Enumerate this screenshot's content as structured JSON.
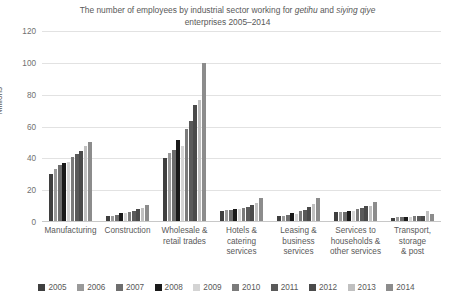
{
  "chart_data": {
    "type": "bar",
    "title": "The number of employees by industrial sector working for getihu and siying qiye enterprises 2005–2014",
    "title_parts": {
      "line1_a": "The number of employees by industrial sector working for ",
      "line1_italic1": "getihu",
      "line1_b": " and ",
      "line1_italic2": "siying",
      "line2_italic": "qiye",
      "line2_b": " enterprises 2005–2014"
    },
    "xlabel": "",
    "ylabel": "Millions",
    "ylim": [
      0,
      120
    ],
    "yticks": [
      0,
      20,
      40,
      60,
      80,
      100,
      120
    ],
    "grid": true,
    "legend_position": "bottom",
    "categories": [
      "Manufacturing",
      "Construction",
      "Wholesale & retail trades",
      "Hotels & catering services",
      "Leasing & business services",
      "Services to households & other services",
      "Transport, storage & post"
    ],
    "category_label_lines": [
      [
        "Manufacturing"
      ],
      [
        "Construction"
      ],
      [
        "Wholesale &",
        "retail trades"
      ],
      [
        "Hotels &",
        "catering",
        "services"
      ],
      [
        "Leasing &",
        "business",
        "services"
      ],
      [
        "Services to",
        "households &",
        "other services"
      ],
      [
        "Transport,",
        "storage",
        "& post"
      ]
    ],
    "series": [
      {
        "name": "2005",
        "color": "#3f3f3f",
        "values": [
          30.0,
          3.5,
          40.5,
          7.0,
          3.5,
          6.0,
          2.5
        ]
      },
      {
        "name": "2006",
        "color": "#9a9a9a",
        "values": [
          33.5,
          3.8,
          43.5,
          7.3,
          4.0,
          6.2,
          3.0
        ]
      },
      {
        "name": "2007",
        "color": "#6e6e6e",
        "values": [
          36.0,
          4.2,
          45.0,
          7.6,
          4.3,
          6.5,
          3.2
        ]
      },
      {
        "name": "2008",
        "color": "#1a1a1a",
        "values": [
          37.0,
          5.5,
          51.5,
          8.3,
          5.5,
          6.8,
          3.3
        ]
      },
      {
        "name": "2009",
        "color": "#d4d4d4",
        "values": [
          37.5,
          5.8,
          47.5,
          8.0,
          5.0,
          7.2,
          3.3
        ]
      },
      {
        "name": "2010",
        "color": "#7b7b7b",
        "values": [
          41.0,
          6.6,
          58.5,
          9.0,
          6.8,
          8.2,
          3.5
        ]
      },
      {
        "name": "2011",
        "color": "#5a5a5a",
        "values": [
          42.5,
          7.0,
          63.5,
          9.6,
          7.8,
          8.8,
          3.6
        ]
      },
      {
        "name": "2012",
        "color": "#4a4a4a",
        "values": [
          44.5,
          8.0,
          73.5,
          10.5,
          9.5,
          9.8,
          4.0
        ]
      },
      {
        "name": "2013",
        "color": "#c0c0c0",
        "values": [
          48.0,
          9.0,
          76.5,
          11.8,
          11.5,
          10.2,
          6.8
        ]
      },
      {
        "name": "2014",
        "color": "#8c8c8c",
        "values": [
          50.5,
          11.0,
          100.0,
          14.8,
          15.0,
          12.5,
          4.8
        ]
      }
    ]
  }
}
